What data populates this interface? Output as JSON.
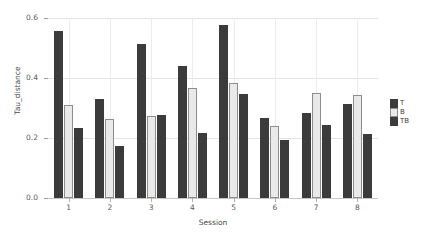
{
  "chart_data": {
    "type": "bar",
    "title": "",
    "xlabel": "Session",
    "ylabel": "Tau_distance",
    "categories": [
      "1",
      "2",
      "3",
      "4",
      "5",
      "6",
      "7",
      "8"
    ],
    "series": [
      {
        "name": "T",
        "color": "#3b3b3b",
        "values": [
          0.556,
          0.33,
          0.513,
          0.44,
          0.577,
          0.267,
          0.283,
          0.315
        ]
      },
      {
        "name": "B",
        "color": "#e9e9e9",
        "values": [
          0.31,
          0.262,
          0.272,
          0.368,
          0.383,
          0.24,
          0.35,
          0.345
        ]
      },
      {
        "name": "TB",
        "color": "#3b3b3b",
        "values": [
          0.233,
          0.172,
          0.277,
          0.218,
          0.347,
          0.193,
          0.242,
          0.215
        ]
      }
    ],
    "ylim": [
      0.0,
      0.6
    ],
    "yticks": [
      "0.0",
      "0.2",
      "0.4",
      "0.6"
    ],
    "ytick_values": [
      0.0,
      0.2,
      0.4,
      0.6
    ],
    "xticks": [
      "1",
      "2",
      "3",
      "4",
      "5",
      "6",
      "7",
      "8"
    ],
    "grid": true,
    "legend_position": "right",
    "legend": [
      "T",
      "B",
      "TB"
    ]
  }
}
